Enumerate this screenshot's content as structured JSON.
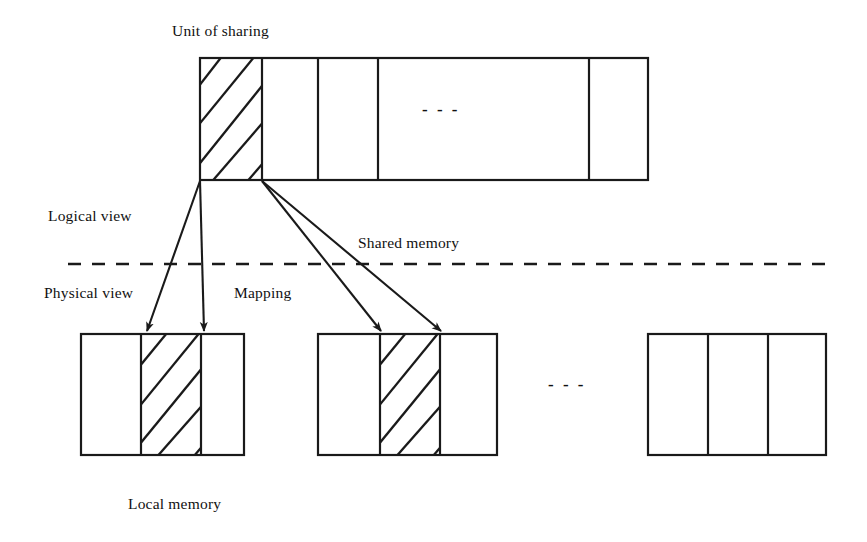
{
  "figure": {
    "background_color": "#ffffff",
    "stroke_color": "#1a1a1a",
    "text_color": "#111111"
  },
  "labels": {
    "unit_of_sharing": "Unit of sharing",
    "logical_view": "Logical view",
    "physical_view": "Physical view",
    "mapping": "Mapping",
    "shared_memory": "Shared memory",
    "local_memory": "Local memory",
    "ellipsis_top": "- - -",
    "ellipsis_bottom": "- - -"
  },
  "shared_memory_bar": {
    "name": "shared-memory-bar",
    "x": 200,
    "y": 58,
    "width": 448,
    "height": 122,
    "dividers_x": [
      262,
      318,
      378,
      589
    ],
    "hatched_cell": {
      "x": 200,
      "width": 62,
      "label": "Unit of sharing"
    }
  },
  "local_memory_blocks": [
    {
      "name": "local-memory-block-1",
      "x": 81,
      "y": 334,
      "width": 163,
      "height": 121,
      "dividers_x": [
        141,
        201
      ],
      "hatched_cell": {
        "x": 141,
        "width": 60
      }
    },
    {
      "name": "local-memory-block-2",
      "x": 318,
      "y": 334,
      "width": 179,
      "height": 121,
      "dividers_x": [
        380,
        440
      ],
      "hatched_cell": {
        "x": 380,
        "width": 60
      }
    },
    {
      "name": "local-memory-block-3",
      "x": 648,
      "y": 334,
      "width": 178,
      "height": 121,
      "dividers_x": [
        708,
        768
      ],
      "hatched_cell": null
    }
  ],
  "mapping_arrows": [
    {
      "name": "mapping-arrow-1",
      "from_x": 200,
      "from_y": 181,
      "to_x": 147,
      "to_y": 331
    },
    {
      "name": "mapping-arrow-2",
      "from_x": 200,
      "from_y": 181,
      "to_x": 204,
      "to_y": 331
    },
    {
      "name": "mapping-arrow-3",
      "from_x": 262,
      "from_y": 181,
      "to_x": 381,
      "to_y": 331
    },
    {
      "name": "mapping-arrow-4",
      "from_x": 262,
      "from_y": 181,
      "to_x": 441,
      "to_y": 331
    }
  ],
  "separator": {
    "name": "logical-physical-divider",
    "x1": 68,
    "x2": 826,
    "y": 264,
    "style": "dashed"
  },
  "label_positions": {
    "unit_of_sharing": {
      "x": 172,
      "y": 22
    },
    "logical_view": {
      "x": 48,
      "y": 207
    },
    "shared_memory": {
      "x": 358,
      "y": 234
    },
    "physical_view": {
      "x": 44,
      "y": 284
    },
    "mapping": {
      "x": 234,
      "y": 284
    },
    "local_memory": {
      "x": 128,
      "y": 495
    },
    "ellipsis_top": {
      "x": 422,
      "y": 104
    },
    "ellipsis_bottom": {
      "x": 548,
      "y": 379
    }
  }
}
